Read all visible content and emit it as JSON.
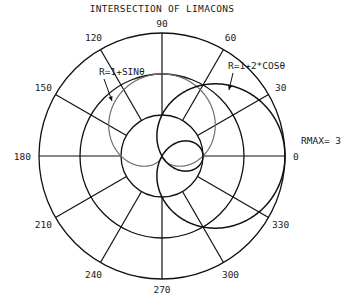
{
  "chart_data": {
    "type": "polar-line",
    "title": "INTERSECTION OF LIMACONS",
    "rmax": 3,
    "rmax_label": "RMAX= 3",
    "radial_rings": [
      1,
      2,
      3
    ],
    "angle_ticks": [
      0,
      30,
      60,
      90,
      120,
      150,
      180,
      210,
      240,
      270,
      300,
      330
    ],
    "angle_tick_labels": [
      "0",
      "30",
      "60",
      "90",
      "120",
      "150",
      "180",
      "210",
      "240",
      "270",
      "300",
      "330"
    ],
    "grid": true,
    "series": [
      {
        "name": "R=1+SINθ",
        "equation": "r = 1 + sin(theta)",
        "color": "#6e6e6e"
      },
      {
        "name": "R=1+2*COSθ",
        "equation": "r = 1 + 2*cos(theta)",
        "color": "#111111"
      }
    ],
    "annotations": [
      {
        "text": "R=1+SINθ",
        "points_to": "R=1+SINθ"
      },
      {
        "text": "R=1+2*COSθ",
        "points_to": "R=1+2*COSθ"
      }
    ]
  },
  "colors": {
    "grid": "#111111",
    "text": "#1a1a1a",
    "background": "#ffffff"
  }
}
